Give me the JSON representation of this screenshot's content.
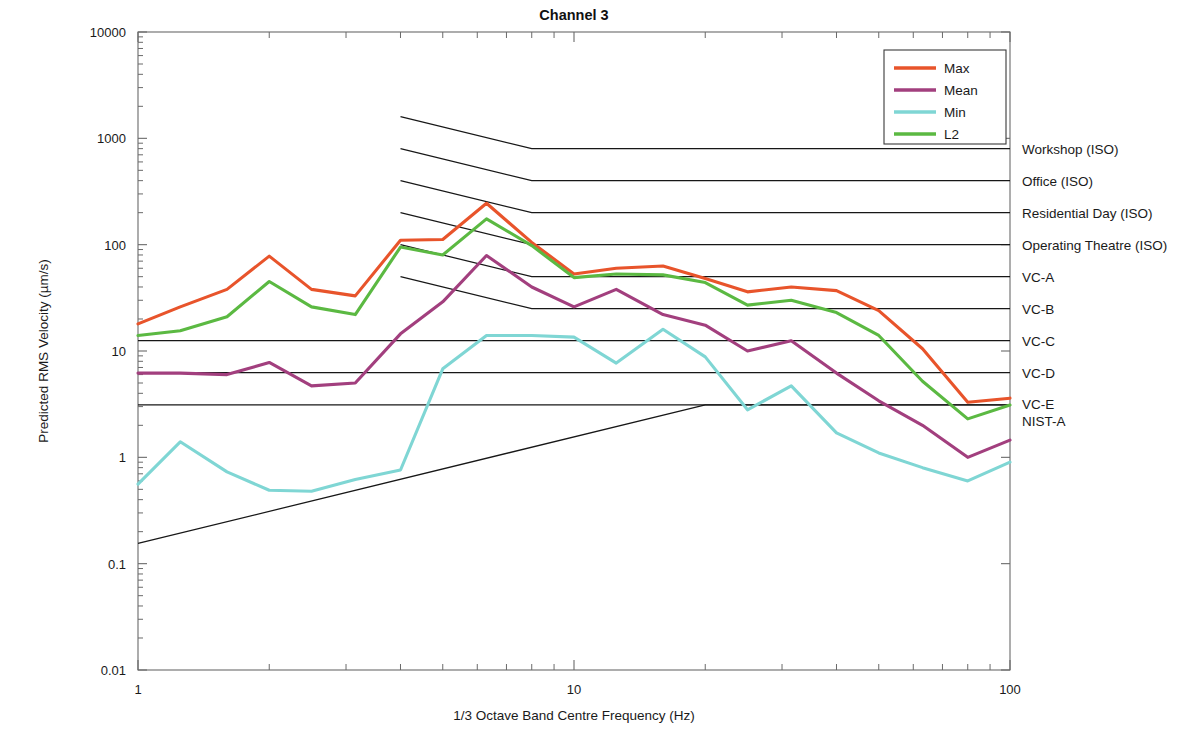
{
  "chart_data": {
    "type": "line",
    "title": "Channel 3",
    "xlabel": "1/3 Octave Band Centre Frequency (Hz)",
    "ylabel": "Predicted RMS Velocity (µm/s)",
    "xscale": "log",
    "yscale": "log",
    "xlim": [
      1,
      100
    ],
    "ylim": [
      0.01,
      10000
    ],
    "grid": false,
    "legend_position": "top-right",
    "xticks": [
      1,
      10,
      100
    ],
    "xtick_labels": [
      "1",
      "10",
      "100"
    ],
    "yticks": [
      0.01,
      0.1,
      1,
      10,
      100,
      1000,
      10000
    ],
    "ytick_labels": [
      "0.01",
      "0.1",
      "1",
      "10",
      "100",
      "1000",
      "10000"
    ],
    "x": [
      1,
      1.25,
      1.6,
      2,
      2.5,
      3.15,
      4,
      5,
      6.3,
      8,
      10,
      12.5,
      16,
      20,
      25,
      31.5,
      40,
      50,
      63,
      80,
      100
    ],
    "series": [
      {
        "name": "Max",
        "color": "#e8542b",
        "values": [
          18,
          26,
          38,
          78,
          38,
          33,
          110,
          112,
          245,
          105,
          53,
          60,
          63,
          48,
          36,
          40,
          37,
          24,
          10.5,
          3.3,
          3.6
        ]
      },
      {
        "name": "Mean",
        "color": "#a23f7e",
        "values": [
          6.2,
          6.2,
          6.0,
          7.8,
          4.7,
          5.0,
          14.5,
          29,
          79,
          40,
          26,
          38,
          22,
          17.5,
          10.0,
          12.5,
          6.2,
          3.4,
          2.0,
          1.0,
          1.45
        ]
      },
      {
        "name": "Min",
        "color": "#7fd6d4",
        "values": [
          0.56,
          1.4,
          0.73,
          0.49,
          0.48,
          0.62,
          0.76,
          6.8,
          14.0,
          14.0,
          13.5,
          7.7,
          16.0,
          8.8,
          2.8,
          4.7,
          1.7,
          1.1,
          0.8,
          0.6,
          0.9
        ]
      },
      {
        "name": "L2",
        "color": "#5bb942",
        "values": [
          14.0,
          15.5,
          21,
          45,
          26,
          22,
          95,
          80,
          175,
          98,
          49,
          53,
          52,
          44,
          27,
          30,
          23,
          14,
          5.2,
          2.3,
          3.1
        ]
      }
    ],
    "criteria": [
      {
        "label": "Workshop (ISO)",
        "start_hz": 4,
        "start_value": 1600,
        "knee_hz": 8,
        "flat_value": 800
      },
      {
        "label": "Office (ISO)",
        "start_hz": 4,
        "start_value": 800,
        "knee_hz": 8,
        "flat_value": 400
      },
      {
        "label": "Residential Day (ISO)",
        "start_hz": 4,
        "start_value": 400,
        "knee_hz": 8,
        "flat_value": 200
      },
      {
        "label": "Operating Theatre (ISO)",
        "start_hz": 4,
        "start_value": 200,
        "knee_hz": 8,
        "flat_value": 100
      },
      {
        "label": "VC-A",
        "start_hz": 4,
        "start_value": 100,
        "knee_hz": 8,
        "flat_value": 50
      },
      {
        "label": "VC-B",
        "start_hz": 4,
        "start_value": 50,
        "knee_hz": 8,
        "flat_value": 25
      },
      {
        "label": "VC-C",
        "start_hz": 1,
        "start_value": 12.5,
        "knee_hz": 1,
        "flat_value": 12.5
      },
      {
        "label": "VC-D",
        "start_hz": 1,
        "start_value": 6.25,
        "knee_hz": 1,
        "flat_value": 6.25
      },
      {
        "label": "VC-E",
        "start_hz": 1,
        "start_value": 3.12,
        "knee_hz": 1,
        "flat_value": 3.12
      },
      {
        "label": "NIST-A",
        "start_hz": 1,
        "start_value": 0.155,
        "knee_hz": 20,
        "flat_value": 3.12
      }
    ]
  },
  "legend": {
    "entries": [
      {
        "label": "Max",
        "color": "#e8542b"
      },
      {
        "label": "Mean",
        "color": "#a23f7e"
      },
      {
        "label": "Min",
        "color": "#7fd6d4"
      },
      {
        "label": "L2",
        "color": "#5bb942"
      }
    ]
  }
}
